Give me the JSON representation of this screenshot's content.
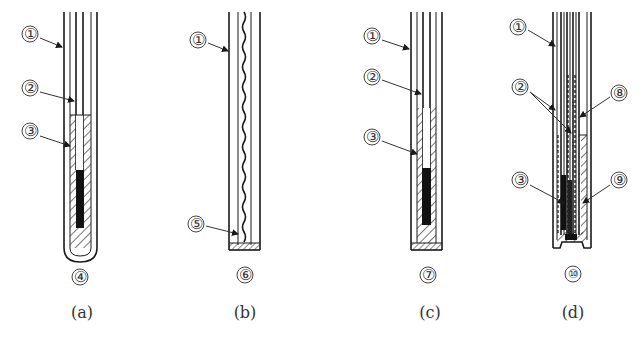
{
  "figure": {
    "panels": [
      {
        "id": "a",
        "caption": "(a)",
        "bottom_label": "④",
        "callouts": [
          {
            "label": "①",
            "target": "outer-sheath"
          },
          {
            "label": "②",
            "target": "conductor-wire"
          },
          {
            "label": "③",
            "target": "insulation-fill"
          }
        ]
      },
      {
        "id": "b",
        "caption": "(b)",
        "bottom_label": "⑥",
        "callouts": [
          {
            "label": "①",
            "target": "outer-sheath"
          },
          {
            "label": "⑤",
            "target": "junction"
          }
        ]
      },
      {
        "id": "c",
        "caption": "(c)",
        "bottom_label": "⑦",
        "callouts": [
          {
            "label": "①",
            "target": "outer-sheath"
          },
          {
            "label": "②",
            "target": "conductor-wire"
          },
          {
            "label": "③",
            "target": "insulation-fill"
          }
        ]
      },
      {
        "id": "d",
        "caption": "(d)",
        "bottom_label": "⑩",
        "callouts": [
          {
            "label": "①",
            "target": "outer-sheath"
          },
          {
            "label": "②",
            "target": "conductor-wires"
          },
          {
            "label": "⑧",
            "target": "inner-tube"
          },
          {
            "label": "③",
            "target": "insulation-fill"
          },
          {
            "label": "⑨",
            "target": "outer-fill"
          }
        ]
      }
    ]
  },
  "colors": {
    "line": "#1a1a1a",
    "text": "#333333",
    "background": "#ffffff"
  }
}
